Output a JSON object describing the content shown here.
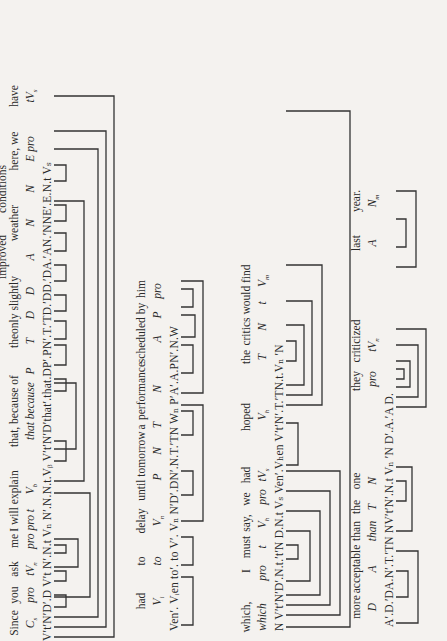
{
  "lines": [
    {
      "id": "line1",
      "words": [
        {
          "x": 18,
          "text": "Since"
        },
        {
          "x": 44,
          "text": "you"
        },
        {
          "x": 70,
          "text": "ask"
        },
        {
          "x": 98,
          "text": "me"
        },
        {
          "x": 130,
          "text": "I will explain"
        },
        {
          "x": 220,
          "text": "that, because of"
        },
        {
          "x": 290,
          "text": "the"
        },
        {
          "x": 316,
          "text": "only slightly"
        },
        {
          "x": 365,
          "text": "improved"
        },
        {
          "x": 410,
          "text": "weather"
        },
        {
          "x": 440,
          "text": "conditions"
        },
        {
          "x": 480,
          "text": "here, we"
        },
        {
          "x": 545,
          "text": "have"
        }
      ],
      "categories": [
        {
          "x": 18,
          "text": "C",
          "sub": "s"
        },
        {
          "x": 44,
          "text": "pro"
        },
        {
          "x": 70,
          "text": "tV",
          "sub": "n"
        },
        {
          "x": 102,
          "text": "pro pro t"
        },
        {
          "x": 148,
          "text": "V",
          "sub": "b"
        },
        {
          "x": 222,
          "text": "that because"
        },
        {
          "x": 258,
          "text": "P"
        },
        {
          "x": 294,
          "text": "T"
        },
        {
          "x": 318,
          "text": "D"
        },
        {
          "x": 340,
          "text": "D"
        },
        {
          "x": 368,
          "text": "A"
        },
        {
          "x": 410,
          "text": "N"
        },
        {
          "x": 440,
          "text": "N"
        },
        {
          "x": 470,
          "text": "E pro"
        },
        {
          "x": 545,
          "text": "tV",
          "sub": "s"
        }
      ],
      "sequence": "V′t′N′D′.D V′t N′.N.t Vₙ N′.N.N.t.Vᵦ V′t′N′D′that′.that.DP′.PN′.T.′TD.′DD.′DA.′AN.′NNE′.E.N.t Vₛ"
    },
    {
      "id": "line2",
      "words": [
        {
          "x": 40,
          "text": "had"
        },
        {
          "x": 78,
          "text": "to"
        },
        {
          "x": 120,
          "text": "delay"
        },
        {
          "x": 165,
          "text": "until tomorrow"
        },
        {
          "x": 205,
          "text": "a"
        },
        {
          "x": 243,
          "text": "performance"
        },
        {
          "x": 300,
          "text": "scheduled by"
        },
        {
          "x": 350,
          "text": "him"
        }
      ],
      "categories": [
        {
          "x": 36,
          "text": "V",
          "sub": "i"
        },
        {
          "x": 78,
          "text": "to"
        },
        {
          "x": 120,
          "text": "V",
          "sub": "n"
        },
        {
          "x": 160,
          "text": "P"
        },
        {
          "x": 190,
          "text": "N"
        },
        {
          "x": 212,
          "text": "T"
        },
        {
          "x": 245,
          "text": "N"
        },
        {
          "x": 300,
          "text": "A"
        },
        {
          "x": 320,
          "text": "P"
        },
        {
          "x": 345,
          "text": "pro"
        }
      ],
      "sequence": "Ven′. Vᵢen to′. to V′. Vₙ N′D′.DN′.N.T.′TN Wₙ P′A′.A.PN′.N.W"
    },
    {
      "id": "line3",
      "words": [
        {
          "x": 18,
          "text": "which,"
        },
        {
          "x": 58,
          "text": "I"
        },
        {
          "x": 78,
          "text": "must"
        },
        {
          "x": 98,
          "text": "say,"
        },
        {
          "x": 118,
          "text": "we"
        },
        {
          "x": 140,
          "text": "had"
        },
        {
          "x": 180,
          "text": "hoped"
        },
        {
          "x": 220,
          "text": ""
        },
        {
          "x": 245,
          "text": "the"
        },
        {
          "x": 288,
          "text": "critics would find"
        }
      ],
      "categories": [
        {
          "x": 18,
          "text": "which"
        },
        {
          "x": 56,
          "text": "pro"
        },
        {
          "x": 80,
          "text": "t"
        },
        {
          "x": 100,
          "text": "V",
          "sub": "h"
        },
        {
          "x": 122,
          "text": "pro"
        },
        {
          "x": 140,
          "text": "tV",
          "sub": "s"
        },
        {
          "x": 185,
          "text": "V",
          "sub": "h"
        },
        {
          "x": 250,
          "text": "T"
        },
        {
          "x": 275,
          "text": "N"
        },
        {
          "x": 298,
          "text": "t"
        },
        {
          "x": 318,
          "text": "V",
          "sub": "m"
        }
      ],
      "sequence": "N V′t′N′D′.N.t.′t′N D.N.t Vₛ Ven′.Vₕen V′t′N′.T.′TN.t.Vₙ ′N"
    },
    {
      "id": "line4",
      "words": [
        {
          "x": 30,
          "text": "more"
        },
        {
          "x": 62,
          "text": "acceptable"
        },
        {
          "x": 100,
          "text": "than"
        },
        {
          "x": 125,
          "text": "the"
        },
        {
          "x": 150,
          "text": "one"
        },
        {
          "x": 230,
          "text": "they"
        },
        {
          "x": 268,
          "text": "criticized"
        },
        {
          "x": 345,
          "text": "last"
        },
        {
          "x": 390,
          "text": "year."
        }
      ],
      "categories": [
        {
          "x": 30,
          "text": "D"
        },
        {
          "x": 62,
          "text": "A"
        },
        {
          "x": 100,
          "text": "than"
        },
        {
          "x": 125,
          "text": "T"
        },
        {
          "x": 150,
          "text": "N"
        },
        {
          "x": 230,
          "text": "pro"
        },
        {
          "x": 262,
          "text": "tV",
          "sub": "n"
        },
        {
          "x": 345,
          "text": "A"
        },
        {
          "x": 390,
          "text": "N",
          "sub": "m"
        }
      ],
      "sequence": "A′.D.′DA.N′.T.′TN NV′t′N′.N.t Vₙ ′N D′.A.′A D."
    }
  ]
}
